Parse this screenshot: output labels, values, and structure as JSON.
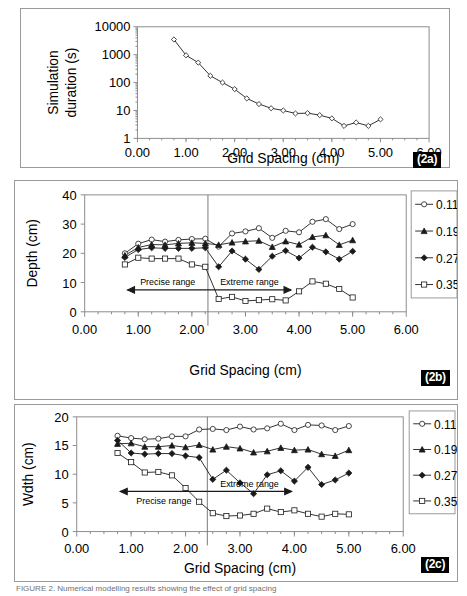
{
  "figure": {
    "caption": "FIGURE 2. Numerical modelling results showing the effect of grid spacing"
  },
  "panels": [
    {
      "tag": "(2a)"
    },
    {
      "tag": "(2b)"
    },
    {
      "tag": "(2c)"
    }
  ],
  "chart_data": [
    {
      "id": "2a",
      "type": "line",
      "title": "",
      "xlabel": "Grid Spacing (cm)",
      "ylabel": "Simulation duration (s)",
      "yscale": "log",
      "xlim": [
        0.0,
        6.0
      ],
      "ylim": [
        1,
        10000
      ],
      "xticks": [
        "0.00",
        "1.00",
        "2.00",
        "3.00",
        "4.00",
        "5.00",
        "6.00"
      ],
      "yticks": [
        "1",
        "10",
        "100",
        "1000",
        "10000"
      ],
      "grid": false,
      "legend": "none",
      "marker": "open-diamond",
      "series": [
        {
          "name": "Simulation duration",
          "x": [
            0.75,
            1.0,
            1.25,
            1.5,
            1.75,
            2.0,
            2.25,
            2.5,
            2.75,
            3.0,
            3.25,
            3.5,
            3.75,
            4.0,
            4.25,
            4.5,
            4.75,
            5.0
          ],
          "values": [
            3500,
            950,
            520,
            175,
            100,
            58,
            27,
            17,
            12,
            10,
            7.8,
            8.0,
            6.8,
            5.2,
            2.8,
            3.7,
            2.8,
            4.8
          ]
        }
      ]
    },
    {
      "id": "2b",
      "type": "line",
      "title": "",
      "xlabel": "Grid Spacing (cm)",
      "ylabel": "Depth (cm)",
      "yscale": "linear",
      "xlim": [
        0.0,
        6.0
      ],
      "ylim": [
        0,
        40
      ],
      "xticks": [
        "0.00",
        "1.00",
        "2.00",
        "3.00",
        "4.00",
        "5.00",
        "6.00"
      ],
      "yticks": [
        "0",
        "10",
        "20",
        "30",
        "40"
      ],
      "grid": false,
      "legend": "right",
      "legend_entries": [
        "0.11",
        "0.19",
        "0.27",
        "0.35"
      ],
      "divider_x": 2.3,
      "annotations": [
        {
          "text": "Precise range",
          "arrow": "left",
          "x_from": 2.3,
          "x_to": 0.8,
          "y": 7.5
        },
        {
          "text": "Extreme range",
          "arrow": "right",
          "x_from": 2.3,
          "x_to": 3.85,
          "y": 7.5
        }
      ],
      "x": [
        0.75,
        1.0,
        1.25,
        1.5,
        1.75,
        2.0,
        2.25,
        2.5,
        2.75,
        3.0,
        3.25,
        3.5,
        3.75,
        4.0,
        4.25,
        4.5,
        4.75,
        5.0
      ],
      "series": [
        {
          "name": "0.11",
          "marker": "open-circle",
          "values": [
            20.0,
            23.3,
            24.7,
            24.0,
            24.6,
            24.9,
            25.0,
            22.3,
            26.8,
            27.5,
            28.6,
            25.3,
            27.7,
            27.2,
            30.8,
            31.7,
            28.3,
            30.0
          ]
        },
        {
          "name": "0.19",
          "marker": "filled-triangle",
          "values": [
            19.3,
            22.0,
            23.0,
            22.9,
            23.4,
            23.6,
            23.4,
            22.9,
            23.7,
            24.1,
            24.3,
            22.2,
            24.1,
            23.0,
            25.6,
            26.2,
            22.9,
            24.5
          ]
        },
        {
          "name": "0.27",
          "marker": "filled-diamond",
          "values": [
            18.6,
            21.3,
            21.9,
            21.7,
            21.7,
            21.7,
            21.9,
            15.4,
            20.8,
            18.0,
            14.5,
            19.0,
            20.9,
            18.4,
            22.1,
            20.5,
            18.0,
            20.7
          ]
        },
        {
          "name": "0.35",
          "marker": "open-square",
          "values": [
            16.2,
            18.5,
            18.2,
            18.2,
            18.2,
            16.2,
            15.4,
            4.4,
            5.1,
            3.7,
            4.0,
            4.3,
            3.9,
            7.0,
            10.4,
            9.6,
            7.8,
            4.9
          ]
        }
      ]
    },
    {
      "id": "2c",
      "type": "line",
      "title": "",
      "xlabel": "Grid Spacing (cm)",
      "ylabel": "Wdth (cm)",
      "yscale": "linear",
      "xlim": [
        0.0,
        6.0
      ],
      "ylim": [
        0,
        20
      ],
      "xticks": [
        "0.00",
        "1.00",
        "2.00",
        "3.00",
        "4.00",
        "5.00",
        "6.00"
      ],
      "yticks": [
        "0",
        "5",
        "10",
        "15",
        "20"
      ],
      "grid": false,
      "legend": "right",
      "legend_entries": [
        "0.11",
        "0.19",
        "0.27",
        "0.35"
      ],
      "divider_x": 2.4,
      "annotations": [
        {
          "text": "Precise range",
          "arrow": "left",
          "x_from": 2.4,
          "x_to": 0.8,
          "y": 7.0
        },
        {
          "text": "Extreme range",
          "arrow": "right",
          "x_from": 2.4,
          "x_to": 3.95,
          "y": 7.0
        }
      ],
      "x": [
        0.75,
        1.0,
        1.25,
        1.5,
        1.75,
        2.0,
        2.25,
        2.5,
        2.75,
        3.0,
        3.25,
        3.5,
        3.75,
        4.0,
        4.25,
        4.5,
        4.75,
        5.0
      ],
      "series": [
        {
          "name": "0.11",
          "marker": "open-circle",
          "values": [
            16.7,
            16.3,
            16.1,
            16.2,
            16.6,
            16.6,
            17.8,
            17.9,
            17.7,
            18.3,
            17.8,
            18.0,
            18.8,
            17.7,
            18.6,
            18.5,
            17.7,
            18.4
          ]
        },
        {
          "name": "0.19",
          "marker": "filled-triangle",
          "values": [
            15.3,
            15.4,
            14.8,
            14.8,
            15.0,
            14.7,
            15.1,
            14.3,
            14.8,
            14.5,
            13.8,
            14.0,
            14.6,
            14.2,
            14.3,
            13.5,
            13.2,
            14.2
          ]
        },
        {
          "name": "0.27",
          "marker": "filled-diamond",
          "values": [
            15.9,
            13.7,
            13.5,
            13.6,
            13.6,
            13.2,
            12.9,
            9.1,
            10.7,
            8.5,
            6.6,
            9.9,
            10.6,
            8.8,
            11.2,
            8.2,
            9.0,
            10.2
          ]
        },
        {
          "name": "0.35",
          "marker": "open-square",
          "values": [
            13.7,
            12.1,
            10.3,
            10.4,
            9.8,
            7.6,
            5.2,
            3.2,
            2.7,
            2.8,
            3.1,
            4.0,
            3.4,
            3.7,
            3.1,
            2.6,
            3.1,
            3.0
          ]
        }
      ]
    }
  ]
}
